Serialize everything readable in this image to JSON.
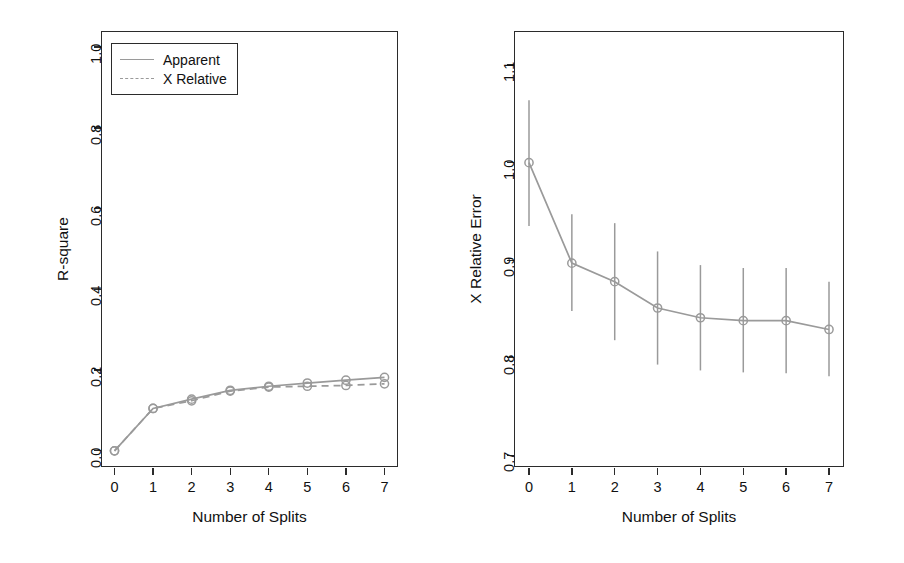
{
  "figure": {
    "background": "#ffffff",
    "series_color": "#9a9a9a",
    "axis_color": "#2b2b2b"
  },
  "chart_data": [
    {
      "type": "line",
      "panel": "left",
      "title": "",
      "xlabel": "Number of Splits",
      "ylabel": "R-square",
      "x": [
        0,
        1,
        2,
        3,
        4,
        5,
        6,
        7
      ],
      "xlim": [
        -0.35,
        7.35
      ],
      "ylim": [
        -0.04,
        1.04
      ],
      "xticks": [
        "0",
        "1",
        "2",
        "3",
        "4",
        "5",
        "6",
        "7"
      ],
      "yticks": [
        "0.0",
        "0.2",
        "0.4",
        "0.6",
        "0.8",
        "1.0"
      ],
      "ytick_values": [
        0.0,
        0.2,
        0.4,
        0.6,
        0.8,
        1.0
      ],
      "grid": false,
      "legend_position": "top-left",
      "markers": "open-circle",
      "series": [
        {
          "name": "Apparent",
          "style": "solid",
          "values": [
            0.0,
            0.105,
            0.128,
            0.15,
            0.16,
            0.168,
            0.175,
            0.182
          ]
        },
        {
          "name": "X Relative",
          "style": "dashed",
          "values": [
            0.0,
            0.105,
            0.124,
            0.148,
            0.158,
            0.16,
            0.162,
            0.166
          ]
        }
      ]
    },
    {
      "type": "line",
      "panel": "right",
      "title": "",
      "xlabel": "Number of Splits",
      "ylabel": "X Relative Error",
      "x": [
        0,
        1,
        2,
        3,
        4,
        5,
        6,
        7
      ],
      "xlim": [
        -0.35,
        7.35
      ],
      "ylim": [
        0.688,
        1.135
      ],
      "xticks": [
        "0",
        "1",
        "2",
        "3",
        "4",
        "5",
        "6",
        "7"
      ],
      "yticks": [
        "0.7",
        "0.8",
        "0.9",
        "1.0",
        "1.1"
      ],
      "ytick_values": [
        0.7,
        0.8,
        0.9,
        1.0,
        1.1
      ],
      "grid": false,
      "legend_position": "none",
      "markers": "open-circle",
      "errorbars": true,
      "series": [
        {
          "name": "X Relative Error",
          "style": "solid",
          "values": [
            1.0,
            0.897,
            0.878,
            0.851,
            0.841,
            0.838,
            0.838,
            0.829
          ],
          "lower": [
            0.935,
            0.848,
            0.818,
            0.793,
            0.787,
            0.785,
            0.784,
            0.781
          ],
          "upper": [
            1.064,
            0.947,
            0.938,
            0.909,
            0.895,
            0.892,
            0.892,
            0.878
          ]
        }
      ]
    }
  ],
  "legend": {
    "items": [
      {
        "label": "Apparent",
        "style": "solid"
      },
      {
        "label": "X Relative",
        "style": "dashed"
      }
    ]
  }
}
